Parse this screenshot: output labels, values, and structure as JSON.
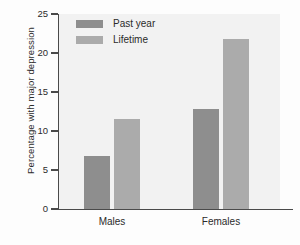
{
  "chart_data": {
    "type": "bar",
    "title": "",
    "xlabel": "",
    "ylabel": "Percentage with major depression",
    "categories": [
      "Males",
      "Females"
    ],
    "series": [
      {
        "name": "Past year",
        "values": [
          6.8,
          12.8
        ],
        "color": "#8e8e8e"
      },
      {
        "name": "Lifetime",
        "values": [
          11.6,
          21.8
        ],
        "color": "#ababab"
      }
    ],
    "ylim": [
      0,
      25
    ],
    "yticks": [
      0,
      5,
      10,
      15,
      20,
      25
    ],
    "ytick_labels": [
      "0",
      "5",
      "10",
      "15",
      "20",
      "25"
    ],
    "grid": false,
    "legend_position": "top-left",
    "plot_background": "#f2f2f2",
    "axis_color": "#4a4a4a"
  },
  "legend": {
    "items": [
      {
        "label": "Past year"
      },
      {
        "label": "Lifetime"
      }
    ]
  }
}
